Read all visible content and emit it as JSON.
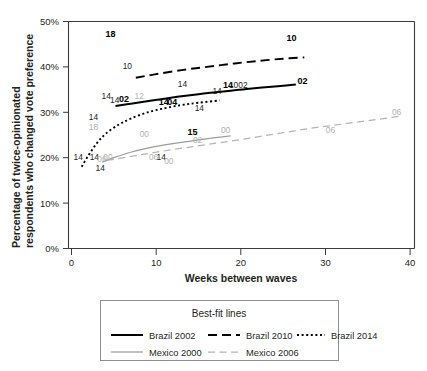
{
  "chart_data": {
    "type": "line",
    "title": "",
    "xlabel": "Weeks between waves",
    "ylabel": "Percentage of twice-opinionated respondents who changed vote preference",
    "xlim": [
      0,
      41
    ],
    "ylim": [
      0,
      52
    ],
    "grid": false,
    "x_ticks": [
      "0",
      "10",
      "20",
      "30",
      "40"
    ],
    "x_tick_values": [
      0,
      10,
      20,
      30,
      40
    ],
    "y_ticks": [
      "0%",
      "10%",
      "20%",
      "30%",
      "40%",
      "50%"
    ],
    "y_tick_values": [
      0,
      10,
      20,
      30,
      40,
      50
    ],
    "legend_position": "below-plot",
    "legend_title": "Best-fit lines",
    "series": [
      {
        "name": "Brazil 2002",
        "style": "solid",
        "color": "#000000",
        "x": [
          5.2,
          7.0,
          9.5,
          12.5,
          15.0,
          17.0,
          18.5,
          21.0,
          24.0,
          26.5
        ],
        "y": [
          31.4,
          31.9,
          32.6,
          33.4,
          34.0,
          34.4,
          34.7,
          35.2,
          35.7,
          36.1
        ]
      },
      {
        "name": "Brazil 2010",
        "style": "dashed",
        "color": "#000000",
        "x": [
          7.6,
          10.0,
          13.0,
          16.0,
          19.0,
          22.0,
          25.0,
          27.5
        ],
        "y": [
          37.6,
          38.4,
          39.3,
          40.0,
          40.7,
          41.3,
          41.8,
          42.1
        ]
      },
      {
        "name": "Brazil 2014",
        "style": "dotted",
        "color": "#000000",
        "x": [
          1.2,
          2.0,
          3.0,
          4.0,
          5.5,
          7.0,
          9.0,
          11.0,
          13.0,
          15.0,
          17.5
        ],
        "y": [
          18.0,
          20.5,
          23.2,
          25.2,
          27.2,
          28.6,
          30.0,
          30.9,
          31.6,
          32.1,
          32.6
        ]
      },
      {
        "name": "Mexico 2000",
        "style": "solid-grey",
        "color": "#9d9d9d",
        "x": [
          3.6,
          5.0,
          7.0,
          9.0,
          11.0,
          13.0,
          15.0,
          17.0,
          18.8
        ],
        "y": [
          19.0,
          20.0,
          21.2,
          22.1,
          22.8,
          23.4,
          23.9,
          24.4,
          24.8
        ]
      },
      {
        "name": "Mexico 2006",
        "style": "dashed-grey",
        "color": "#b4b4b4",
        "x": [
          4.2,
          8.0,
          12.0,
          16.0,
          20.0,
          24.0,
          28.0,
          32.0,
          36.0,
          39.0
        ],
        "y": [
          19.4,
          20.6,
          21.8,
          22.9,
          24.0,
          25.2,
          26.4,
          27.4,
          28.4,
          29.2
        ]
      }
    ],
    "point_labels": [
      {
        "text": "18",
        "x": 4.6,
        "y": 46.5,
        "style": "bold"
      },
      {
        "text": "10",
        "x": 26.0,
        "y": 45.8,
        "style": "bold"
      },
      {
        "text": "10",
        "x": 6.6,
        "y": 39.5,
        "style": "normal"
      },
      {
        "text": "14",
        "x": 13.1,
        "y": 35.5,
        "style": "normal"
      },
      {
        "text": "14",
        "x": 4.1,
        "y": 32.9,
        "style": "normal"
      },
      {
        "text": "14",
        "x": 5.1,
        "y": 32.0,
        "style": "normal"
      },
      {
        "text": "02",
        "x": 6.2,
        "y": 32.2,
        "style": "bold"
      },
      {
        "text": "12",
        "x": 8.0,
        "y": 32.9,
        "style": "grey"
      },
      {
        "text": "14",
        "x": 17.2,
        "y": 34.0,
        "style": "normal"
      },
      {
        "text": "14",
        "x": 18.5,
        "y": 35.3,
        "style": "bold"
      },
      {
        "text": "1002",
        "x": 19.7,
        "y": 35.3,
        "style": "normal"
      },
      {
        "text": "02",
        "x": 27.3,
        "y": 36.2,
        "style": "bold"
      },
      {
        "text": "14",
        "x": 10.9,
        "y": 31.6,
        "style": "bold"
      },
      {
        "text": "04",
        "x": 11.9,
        "y": 31.5,
        "style": "bold"
      },
      {
        "text": "14",
        "x": 15.1,
        "y": 30.2,
        "style": "normal"
      },
      {
        "text": "14",
        "x": 2.6,
        "y": 28.2,
        "style": "normal"
      },
      {
        "text": "18",
        "x": 2.6,
        "y": 26.0,
        "style": "grey"
      },
      {
        "text": "14",
        "x": 0.8,
        "y": 19.6,
        "style": "normal"
      },
      {
        "text": "14",
        "x": 2.7,
        "y": 19.4,
        "style": "normal"
      },
      {
        "text": "06",
        "x": 3.6,
        "y": 19.0,
        "style": "grey"
      },
      {
        "text": "00",
        "x": 4.3,
        "y": 19.6,
        "style": "grey"
      },
      {
        "text": "14",
        "x": 3.4,
        "y": 17.0,
        "style": "normal"
      },
      {
        "text": "00",
        "x": 8.6,
        "y": 24.6,
        "style": "grey"
      },
      {
        "text": "06",
        "x": 9.7,
        "y": 19.6,
        "style": "grey"
      },
      {
        "text": "14",
        "x": 10.6,
        "y": 19.6,
        "style": "normal"
      },
      {
        "text": "00",
        "x": 11.5,
        "y": 18.6,
        "style": "grey"
      },
      {
        "text": "15",
        "x": 14.3,
        "y": 24.9,
        "style": "bold"
      },
      {
        "text": "02",
        "x": 14.9,
        "y": 23.2,
        "style": "grey"
      },
      {
        "text": "00",
        "x": 18.2,
        "y": 25.5,
        "style": "grey"
      },
      {
        "text": "06",
        "x": 30.6,
        "y": 25.4,
        "style": "grey"
      },
      {
        "text": "06",
        "x": 38.4,
        "y": 29.4,
        "style": "grey"
      }
    ]
  },
  "legend": {
    "title": "Best-fit lines",
    "entries": [
      {
        "label": "Brazil 2002",
        "style": "solid",
        "color": "#000000"
      },
      {
        "label": "Brazil 2010",
        "style": "dashed",
        "color": "#000000"
      },
      {
        "label": "Brazil 2014",
        "style": "dotted",
        "color": "#000000"
      },
      {
        "label": "Mexico 2000",
        "style": "solid-grey",
        "color": "#9d9d9d"
      },
      {
        "label": "Mexico 2006",
        "style": "dashed-grey",
        "color": "#b4b4b4"
      }
    ]
  }
}
